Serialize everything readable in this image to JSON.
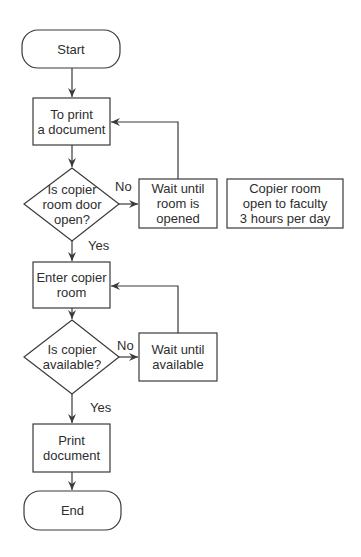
{
  "diagram": {
    "type": "flowchart",
    "nodes": {
      "start": {
        "shape": "terminal",
        "text": "Start"
      },
      "to_print": {
        "shape": "process",
        "text": "To print\na document"
      },
      "door_open": {
        "shape": "decision",
        "text": "Is copier\nroom door\nopen?"
      },
      "wait_room": {
        "shape": "process",
        "text": "Wait until\nroom is\nopened"
      },
      "note": {
        "shape": "annotation",
        "text": "Copier room\nopen to faculty\n3 hours per day"
      },
      "enter_room": {
        "shape": "process",
        "text": "Enter copier\nroom"
      },
      "copier_available": {
        "shape": "decision",
        "text": "Is copier\navailable?"
      },
      "wait_available": {
        "shape": "process",
        "text": "Wait until\navailable"
      },
      "print_doc": {
        "shape": "process",
        "text": "Print\ndocument"
      },
      "end": {
        "shape": "terminal",
        "text": "End"
      }
    },
    "edge_labels": {
      "door_no": "No",
      "door_yes": "Yes",
      "avail_no": "No",
      "avail_yes": "Yes"
    },
    "edges": [
      {
        "from": "start",
        "to": "to_print"
      },
      {
        "from": "to_print",
        "to": "door_open"
      },
      {
        "from": "door_open",
        "to": "wait_room",
        "label": "No"
      },
      {
        "from": "wait_room",
        "to": "to_print"
      },
      {
        "from": "door_open",
        "to": "enter_room",
        "label": "Yes"
      },
      {
        "from": "enter_room",
        "to": "copier_available"
      },
      {
        "from": "copier_available",
        "to": "wait_available",
        "label": "No"
      },
      {
        "from": "wait_available",
        "to": "enter_room"
      },
      {
        "from": "copier_available",
        "to": "print_doc",
        "label": "Yes"
      },
      {
        "from": "print_doc",
        "to": "end"
      }
    ],
    "colors": {
      "stroke": "#3a3a3a",
      "text": "#2e2e2e",
      "background": "#ffffff"
    }
  }
}
